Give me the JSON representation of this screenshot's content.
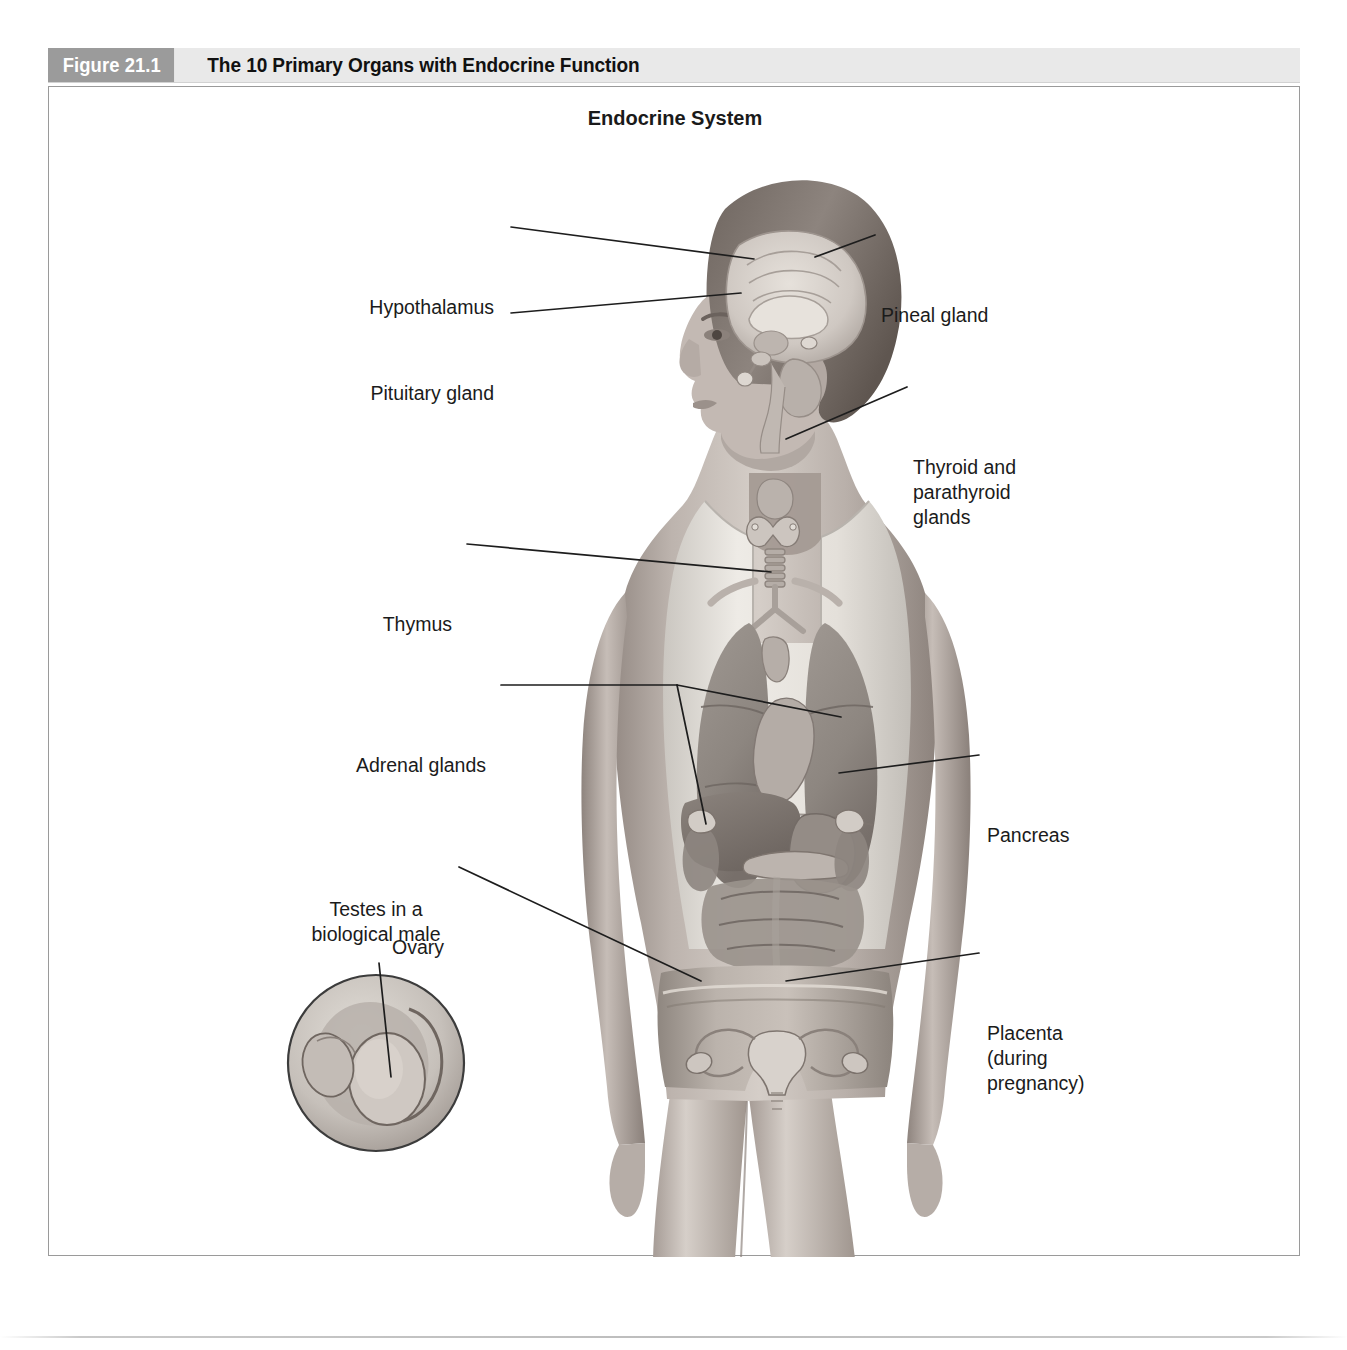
{
  "figure": {
    "number": "Figure 21.1",
    "title": "The 10 Primary Organs with Endocrine Function",
    "subtitle": "Endocrine System"
  },
  "labels": {
    "hypothalamus": "Hypothalamus",
    "pituitary": "Pituitary gland",
    "pineal": "Pineal gland",
    "thyroid": "Thyroid and\nparathyroid\nglands",
    "thymus": "Thymus",
    "adrenal": "Adrenal glands",
    "pancreas": "Pancreas",
    "ovary": "Ovary",
    "placenta": "Placenta\n(during\npregnancy)",
    "testes": "Testes in a\nbiological male"
  },
  "colors": {
    "figure_number_bg": "#9b9b9b",
    "header_bg": "#e9e9e9",
    "title_text": "#111111",
    "label_text": "#1b1b1b",
    "frame_border": "#9a9a9a",
    "leader_line": "#1d1d1d",
    "skin_light": "#cfc7c1",
    "skin_mid": "#a89e98",
    "skin_dark": "#7d736d",
    "garment": "#dedbd6",
    "organ_mid": "#9d9791",
    "organ_dark": "#736d68",
    "brain_light": "#d8d3cd"
  }
}
